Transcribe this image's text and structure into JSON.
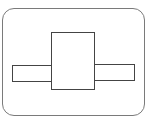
{
  "diagram": {
    "colors": {
      "frame_stroke": "#7a7a7a",
      "shape_stroke": "#444444",
      "fill": "#ffffff",
      "background": "#ffffff"
    },
    "shapes": [
      {
        "id": "outer-frame",
        "type": "rounded-rect",
        "x": 2,
        "y": 8,
        "w": 143,
        "h": 108,
        "radius": 12
      },
      {
        "id": "left-bar",
        "type": "rect",
        "x": 12,
        "y": 65,
        "w": 40,
        "h": 17
      },
      {
        "id": "right-bar",
        "type": "rect",
        "x": 94,
        "y": 64,
        "w": 41,
        "h": 17
      },
      {
        "id": "center-block",
        "type": "rect",
        "x": 51,
        "y": 32,
        "w": 44,
        "h": 58
      }
    ]
  }
}
